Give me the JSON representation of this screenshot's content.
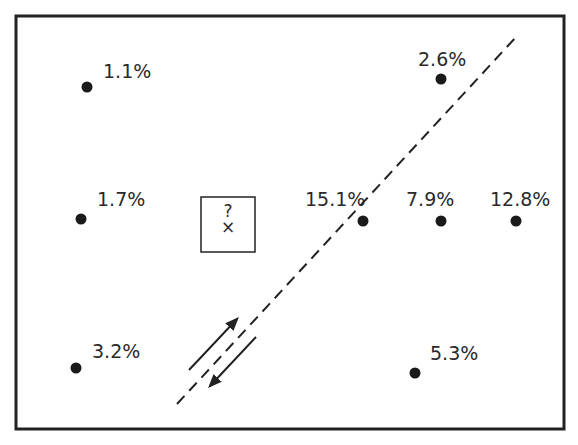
{
  "diagram": {
    "frame": {
      "x": 16,
      "y": 16,
      "w": 548,
      "h": 413,
      "stroke": "#222222"
    },
    "points": [
      {
        "id": "p1",
        "label": "1.1%",
        "x": 87,
        "y": 87,
        "lx": 103,
        "ly": 78
      },
      {
        "id": "p2",
        "label": "1.7%",
        "x": 81,
        "y": 219,
        "lx": 97,
        "ly": 206
      },
      {
        "id": "p3",
        "label": "3.2%",
        "x": 76,
        "y": 368,
        "lx": 92,
        "ly": 358
      },
      {
        "id": "p4",
        "label": "2.6%",
        "x": 441,
        "y": 79,
        "lx": 418,
        "ly": 66
      },
      {
        "id": "p5",
        "label": "15.1%",
        "x": 363,
        "y": 221,
        "lx": 305,
        "ly": 206
      },
      {
        "id": "p6",
        "label": "7.9%",
        "x": 441,
        "y": 221,
        "lx": 406,
        "ly": 206
      },
      {
        "id": "p7",
        "label": "12.8%",
        "x": 516,
        "y": 221,
        "lx": 490,
        "ly": 206
      },
      {
        "id": "p8",
        "label": "5.3%",
        "x": 415,
        "y": 373,
        "lx": 430,
        "ly": 360
      }
    ],
    "unknown_box": {
      "x": 201,
      "y": 197,
      "w": 54,
      "h": 55,
      "question_label": "?",
      "marker_label": "×"
    },
    "fault_line": {
      "x1": 177,
      "y1": 404,
      "x2": 517,
      "y2": 36,
      "dash": "11,7"
    },
    "arrows": [
      {
        "direction": "up-right",
        "x1": 189,
        "y1": 370,
        "x2": 237,
        "y2": 319
      },
      {
        "direction": "down-left",
        "x1": 256,
        "y1": 337,
        "x2": 210,
        "y2": 386
      }
    ],
    "colors": {
      "ink": "#222222",
      "background": "#ffffff"
    }
  }
}
